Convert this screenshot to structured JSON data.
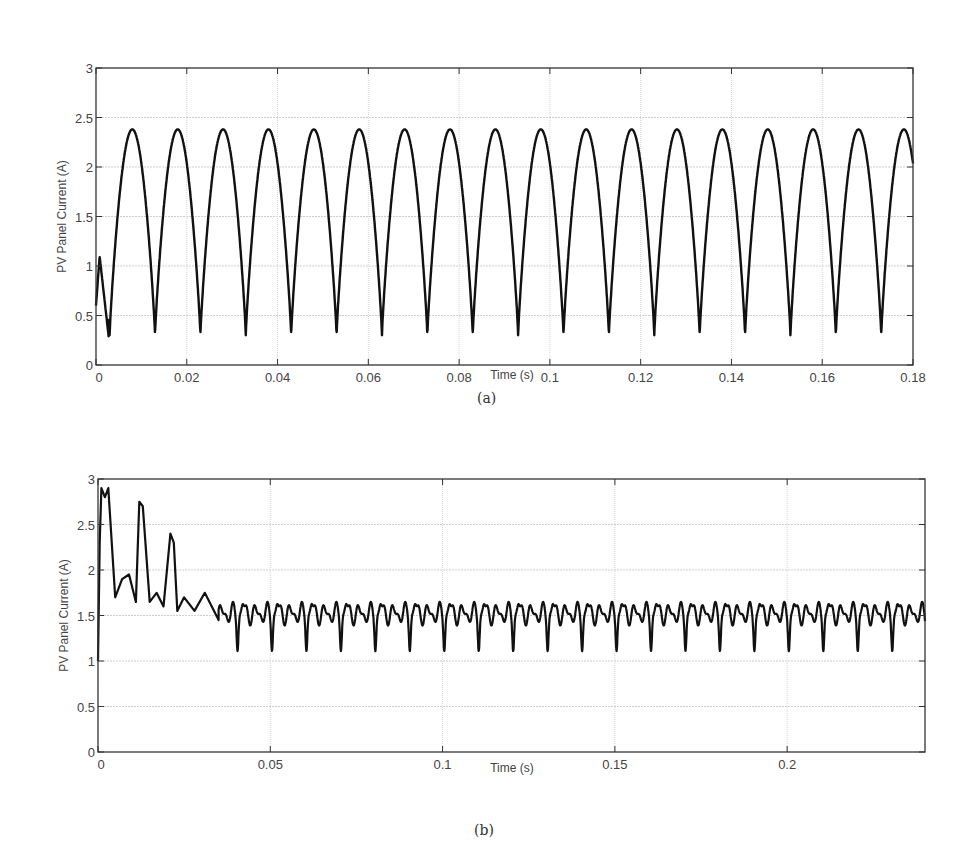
{
  "figure": {
    "panels": [
      {
        "id": "a",
        "caption": "(a)"
      },
      {
        "id": "b",
        "caption": "(b)"
      }
    ]
  },
  "chart_data": [
    {
      "type": "line",
      "panel": "(a)",
      "title": "",
      "xlabel": "Time (s)",
      "ylabel": "PV Panel Current (A)",
      "xlim": [
        0,
        0.18
      ],
      "ylim": [
        0,
        3
      ],
      "xticks": [
        "0",
        "0.02",
        "0.04",
        "0.06",
        "0.08",
        "0.1",
        "0.12",
        "0.14",
        "0.16",
        "0.18"
      ],
      "yticks": [
        "0",
        "0.5",
        "1",
        "1.5",
        "2",
        "2.5",
        "3"
      ],
      "grid": true,
      "legend": null,
      "series": [
        {
          "name": "PV panel current",
          "description": "Rectified-sinusoid-like ripple at 100 Hz (period 0.01 s) oscillating between ~0.3 A and ~2.38 A after a brief start-up transient peaking ~1.1 A near t=0.001 s",
          "x": [
            0,
            0.001,
            0.003,
            0.008,
            0.013,
            0.018,
            0.023,
            0.028,
            0.033,
            0.038,
            0.043,
            0.048,
            0.053,
            0.058,
            0.063,
            0.068,
            0.073,
            0.078,
            0.083,
            0.088,
            0.093,
            0.098,
            0.103,
            0.108,
            0.113,
            0.118,
            0.123,
            0.128,
            0.133,
            0.138,
            0.143,
            0.148,
            0.153,
            0.158,
            0.163,
            0.168,
            0.173,
            0.178,
            0.18
          ],
          "values": [
            0.6,
            1.1,
            0.28,
            2.38,
            0.3,
            2.38,
            0.3,
            2.38,
            0.3,
            2.38,
            0.3,
            2.38,
            0.3,
            2.38,
            0.3,
            2.38,
            0.3,
            2.38,
            0.3,
            2.38,
            0.3,
            2.38,
            0.3,
            2.38,
            0.3,
            2.38,
            0.3,
            2.38,
            0.3,
            2.38,
            0.3,
            2.38,
            0.3,
            2.38,
            0.3,
            2.38,
            0.3,
            2.4,
            1.95
          ]
        }
      ]
    },
    {
      "type": "line",
      "panel": "(b)",
      "title": "",
      "xlabel": "Time (s)",
      "ylabel": "PV Panel Current (A)",
      "xlim": [
        0,
        0.24
      ],
      "ylim": [
        0,
        3
      ],
      "xticks": [
        "0",
        "0.05",
        "0.1",
        "0.15",
        "0.2"
      ],
      "yticks": [
        "0",
        "0.5",
        "1",
        "1.5",
        "2",
        "2.5",
        "3"
      ],
      "grid": true,
      "legend": null,
      "series": [
        {
          "name": "PV panel current",
          "description": "Start-up transient with peaks ~2.9 A, ~2.75 A, ~2.4 A, settling to ~1.5 A with small ripple (dips to ~1.2 A every ~0.01 s)",
          "x": [
            0,
            0.0005,
            0.001,
            0.002,
            0.003,
            0.005,
            0.007,
            0.009,
            0.011,
            0.012,
            0.013,
            0.015,
            0.017,
            0.019,
            0.021,
            0.022,
            0.023,
            0.025,
            0.028,
            0.031,
            0.035,
            0.04,
            0.05,
            0.06,
            0.08,
            0.1,
            0.12,
            0.15,
            0.18,
            0.2,
            0.22,
            0.24
          ],
          "values": [
            1.0,
            2.3,
            2.9,
            2.8,
            2.9,
            1.7,
            1.9,
            1.95,
            1.65,
            2.75,
            2.7,
            1.65,
            1.75,
            1.6,
            2.4,
            2.3,
            1.55,
            1.7,
            1.55,
            1.75,
            1.45,
            1.6,
            1.55,
            1.5,
            1.52,
            1.5,
            1.5,
            1.5,
            1.5,
            1.5,
            1.5,
            1.5
          ],
          "steady_state": {
            "mean": 1.5,
            "ripple_max": 1.68,
            "ripple_min": 1.2,
            "ripple_period_s": 0.01
          }
        }
      ]
    }
  ]
}
